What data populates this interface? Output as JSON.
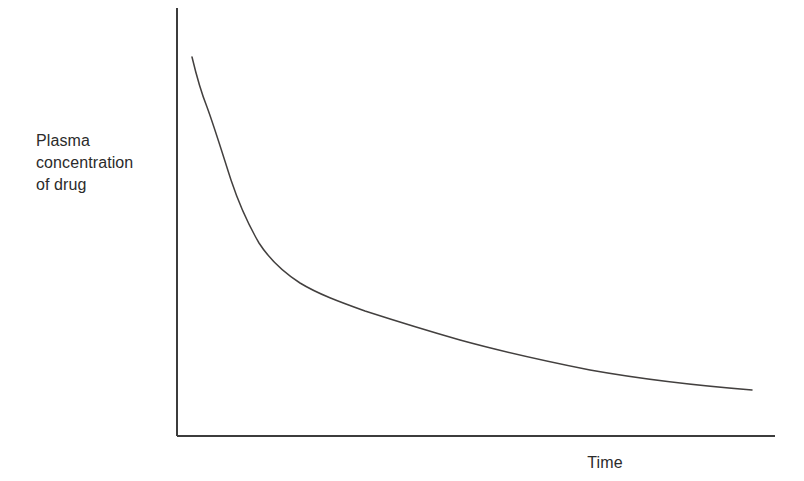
{
  "figure": {
    "background_color": "#ffffff",
    "width": 804,
    "height": 481,
    "axis_color": "#3c3c3c",
    "curve_color": "#43403f",
    "text_color": "#2b2b2b"
  },
  "labels": {
    "ylabel": "Plasma\nconcentration\nof drug",
    "ylabel_line1": "Plasma",
    "ylabel_line2": "concentration",
    "ylabel_line3": "of drug",
    "xlabel": "Time"
  },
  "chart_data": {
    "type": "line",
    "title": "",
    "subtitle": "",
    "xlabel": "Time",
    "ylabel": "Plasma concentration of drug",
    "grid": false,
    "legend": false,
    "legend_position": "none",
    "axis_ticks": false,
    "tick_labels": [],
    "xlim": [
      0,
      100
    ],
    "ylim": [
      0,
      100
    ],
    "annotations": [],
    "series": [
      {
        "name": "Plasma concentration of drug",
        "color": "#43403f",
        "line_width": 1.5,
        "shape": "exponential-decay",
        "x": [
          2.5,
          4.7,
          6.2,
          8.9,
          12.2,
          17.2,
          20.6,
          27.3,
          37.3,
          47.4,
          54.1,
          60.8,
          70.8,
          80.9,
          87.6,
          96.2
        ],
        "y": [
          88.5,
          78.5,
          74.4,
          65.1,
          57.5,
          51.7,
          48.2,
          43.7,
          38.3,
          34.7,
          32.8,
          31.2,
          28.9,
          26.5,
          24.9,
          22.4
        ]
      }
    ]
  }
}
